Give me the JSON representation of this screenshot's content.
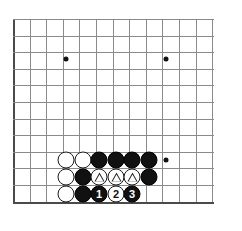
{
  "diagram": {
    "kind": "go-board-diagram",
    "board": {
      "grid_color": "#8a8a8a",
      "border_color": "#4a4a4a",
      "background": "#ffffff",
      "spacing_px": 16.6,
      "origin_x": 13,
      "origin_y": 19,
      "cols": 13,
      "rows": 12,
      "star_points": [
        {
          "x": 66,
          "y": 59
        },
        {
          "x": 166,
          "y": 59
        },
        {
          "x": 166,
          "y": 160
        }
      ]
    },
    "stones": [
      {
        "id": "w-a",
        "color": "white",
        "x": 66,
        "y": 160,
        "label": "",
        "marker": "none"
      },
      {
        "id": "w-b",
        "color": "white",
        "x": 83,
        "y": 160,
        "label": "",
        "marker": "none"
      },
      {
        "id": "b-a",
        "color": "black",
        "x": 99,
        "y": 160,
        "label": "",
        "marker": "none"
      },
      {
        "id": "b-b",
        "color": "black",
        "x": 116,
        "y": 160,
        "label": "",
        "marker": "none"
      },
      {
        "id": "b-c",
        "color": "black",
        "x": 132,
        "y": 160,
        "label": "",
        "marker": "none"
      },
      {
        "id": "b-d",
        "color": "black",
        "x": 149,
        "y": 160,
        "label": "",
        "marker": "none"
      },
      {
        "id": "w-c",
        "color": "white",
        "x": 66,
        "y": 177,
        "label": "",
        "marker": "none"
      },
      {
        "id": "b-e",
        "color": "black",
        "x": 83,
        "y": 177,
        "label": "",
        "marker": "none"
      },
      {
        "id": "w-t1",
        "color": "white",
        "x": 99,
        "y": 177,
        "label": "",
        "marker": "triangle"
      },
      {
        "id": "w-t2",
        "color": "white",
        "x": 116,
        "y": 177,
        "label": "",
        "marker": "triangle"
      },
      {
        "id": "w-t3",
        "color": "white",
        "x": 132,
        "y": 177,
        "label": "",
        "marker": "triangle"
      },
      {
        "id": "b-f",
        "color": "black",
        "x": 149,
        "y": 177,
        "label": "",
        "marker": "none"
      },
      {
        "id": "w-d",
        "color": "white",
        "x": 66,
        "y": 194,
        "label": "",
        "marker": "none"
      },
      {
        "id": "b-g",
        "color": "black",
        "x": 83,
        "y": 194,
        "label": "",
        "marker": "none"
      },
      {
        "id": "m-1",
        "color": "black",
        "x": 99,
        "y": 194,
        "label": "1",
        "marker": "number"
      },
      {
        "id": "m-2",
        "color": "white",
        "x": 116,
        "y": 194,
        "label": "2",
        "marker": "number"
      },
      {
        "id": "m-3",
        "color": "black",
        "x": 132,
        "y": 194,
        "label": "3",
        "marker": "number"
      }
    ],
    "move_sequence": [
      "1",
      "2",
      "3"
    ],
    "marked_stones_symbol": "triangle"
  }
}
